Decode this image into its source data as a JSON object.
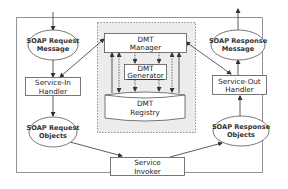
{
  "diagram": {
    "nodes": {
      "soap_request_message": {
        "line1": "SOAP Request",
        "line2": "Message",
        "shape": "ellipse"
      },
      "service_in_handler": {
        "line1": "Service-In",
        "line2": "Handler",
        "shape": "rect"
      },
      "soap_request_objects": {
        "line1": "SOAP Request",
        "line2": "Objects",
        "shape": "ellipse"
      },
      "service_invoker": {
        "line1": "Service",
        "line2": "Invoker",
        "shape": "rect"
      },
      "soap_response_objects": {
        "line1": "SOAP Response",
        "line2": "Objects",
        "shape": "ellipse"
      },
      "service_out_handler": {
        "line1": "Service-Out",
        "line2": "Handler",
        "shape": "rect"
      },
      "soap_response_message": {
        "line1": "SOAP Response",
        "line2": "Message",
        "shape": "ellipse"
      },
      "dmt_manager": {
        "line1": "DMT",
        "line2": "Manager",
        "shape": "rect"
      },
      "dmt_generator": {
        "line1": "DMT",
        "line2": "Generator",
        "shape": "rect"
      },
      "dmt_registry": {
        "line1": "DMT",
        "line2": "Registry",
        "shape": "cylinder"
      }
    },
    "edges": [
      {
        "from": "input",
        "to": "soap_request_message"
      },
      {
        "from": "soap_request_message",
        "to": "service_in_handler"
      },
      {
        "from": "service_in_handler",
        "to": "dmt_manager",
        "bidirectional": true
      },
      {
        "from": "service_in_handler",
        "to": "soap_request_objects"
      },
      {
        "from": "soap_request_objects",
        "to": "service_invoker"
      },
      {
        "from": "service_invoker",
        "to": "soap_response_objects"
      },
      {
        "from": "soap_response_objects",
        "to": "service_out_handler"
      },
      {
        "from": "service_out_handler",
        "to": "dmt_manager",
        "bidirectional": true
      },
      {
        "from": "service_out_handler",
        "to": "soap_response_message"
      },
      {
        "from": "soap_response_message",
        "to": "output"
      },
      {
        "from": "dmt_manager",
        "to": "dmt_generator",
        "style": "dashed"
      },
      {
        "from": "dmt_generator",
        "to": "dmt_registry",
        "style": "dashed"
      },
      {
        "from": "dmt_manager",
        "to": "dmt_registry",
        "bidirectional": true
      },
      {
        "from": "dmt_manager",
        "to": "dmt_registry",
        "style": "dashed",
        "bidirectional": true
      }
    ],
    "colors": {
      "stroke": "#555555",
      "dmt_panel_fill": "#ececec",
      "node_fill": "#ffffff",
      "text": "#333333"
    }
  }
}
